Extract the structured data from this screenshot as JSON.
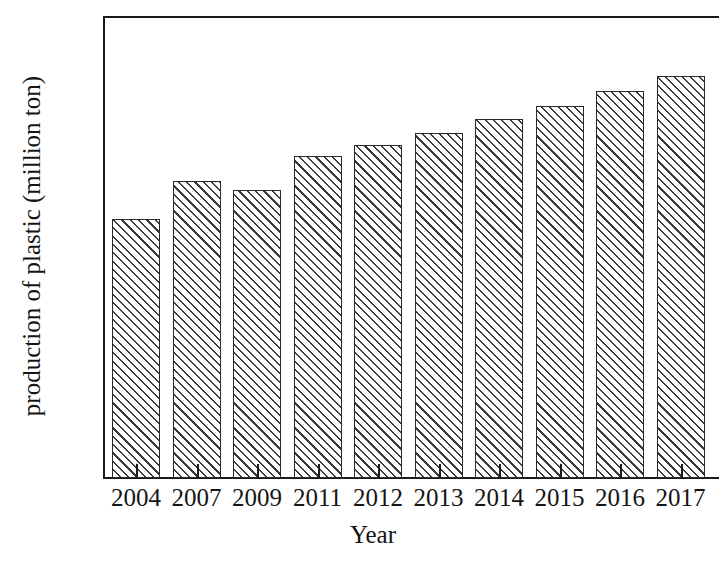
{
  "chart_data": {
    "type": "bar",
    "title": "",
    "xlabel": "Year",
    "ylabel": "production of plastic (million ton)",
    "categories": [
      "2004",
      "2007",
      "2009",
      "2011",
      "2012",
      "2013",
      "2014",
      "2015",
      "2016",
      "2017"
    ],
    "values": [
      224,
      257,
      249,
      279,
      288,
      299,
      311,
      322,
      335,
      348
    ],
    "ylim": [
      0,
      400
    ],
    "ytick_labels": [
      "400",
      "350",
      "300",
      "250",
      "200",
      "150",
      "100",
      "50",
      "0"
    ],
    "ytick_values": [
      400,
      350,
      300,
      250,
      200,
      150,
      100,
      50,
      0
    ],
    "grid": false,
    "legend": null,
    "series_fill": "white-with-diagonal-hatch",
    "axis_color": "#1a1a1a",
    "hatch_color": "#3a3a3a"
  },
  "figure": {
    "background_color": "#ffffff",
    "y_axis_title": "production of plastic (million ton)",
    "x_axis_title": "Year"
  }
}
